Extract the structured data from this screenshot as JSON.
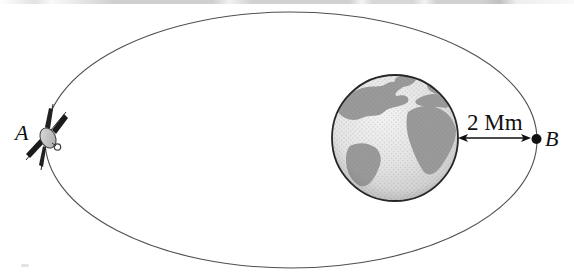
{
  "diagram": {
    "labels": {
      "point_a": "A",
      "point_b": "B",
      "distance": "2 Mm"
    },
    "icons": {
      "satellite": "satellite-icon",
      "earth": "earth-globe-icon",
      "orbit": "orbit-ellipse",
      "arrow": "double-headed-arrow-icon",
      "perigee_marker": "point-b-dot"
    },
    "colors": {
      "background": "#ffffff",
      "orbit_stroke": "#4f4f4f",
      "text": "#101010",
      "earth_outline": "#262626",
      "earth_land": "#9a9a9a",
      "earth_ocean_light": "#f2f2f2",
      "earth_ocean_dark": "#b6b6b6",
      "arrow": "#111111"
    }
  }
}
